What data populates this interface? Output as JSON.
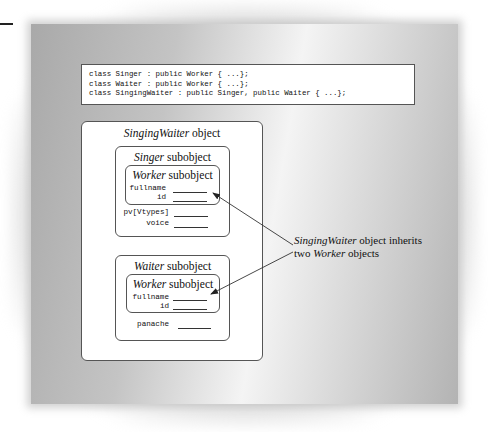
{
  "code_block": {
    "lines": [
      "class Singer : public Worker { ...};",
      "class Waiter : public Worker { ...};",
      "class SingingWaiter : public Singer, public Waiter { ...};"
    ]
  },
  "outer_object": {
    "title_italic": "SingingWaiter",
    "title_rest": " object"
  },
  "singer_subobject": {
    "title_italic": "Singer",
    "title_rest": " subobject",
    "worker": {
      "title_italic": "Worker",
      "title_rest": " subobject",
      "fields": [
        "fullname",
        "id"
      ]
    },
    "fields": [
      "pv[Vtypes]",
      "voice"
    ]
  },
  "waiter_subobject": {
    "title_italic": "Waiter",
    "title_rest": " subobject",
    "worker": {
      "title_italic": "Worker",
      "title_rest": " subobject",
      "fields": [
        "fullname",
        "id"
      ]
    },
    "fields": [
      "panache"
    ]
  },
  "annotation": {
    "line1_italic": "SingingWaiter",
    "line1_rest": " object inherits",
    "line2_start": "two ",
    "line2_italic": "Worker",
    "line2_rest": " objects"
  },
  "colors": {
    "line": "#333333",
    "box_fill": "#ffffff",
    "panel_gray": "#a9a9a9"
  }
}
